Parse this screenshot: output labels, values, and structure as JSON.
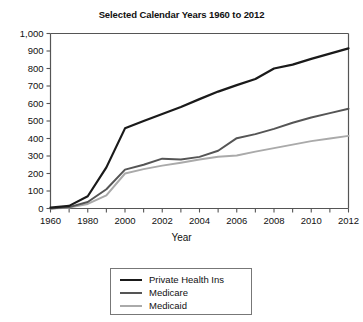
{
  "chart_data": {
    "type": "line",
    "title": "Selected Calendar Years 1960 to 2012",
    "xlabel": "Year",
    "ylabel": "",
    "ylim": [
      0,
      1000
    ],
    "ytick_labels": [
      "0",
      "100",
      "200",
      "300",
      "400",
      "500",
      "600",
      "700",
      "800",
      "900",
      "1,000"
    ],
    "ytick_values": [
      0,
      100,
      200,
      300,
      400,
      500,
      600,
      700,
      800,
      900,
      1000
    ],
    "grid": false,
    "legend_position": "below-center",
    "x": [
      "1960",
      "1970",
      "1980",
      "1990",
      "2000",
      "2001",
      "2002",
      "2003",
      "2004",
      "2005",
      "2006",
      "2007",
      "2008",
      "2009",
      "2010",
      "2011",
      "2012"
    ],
    "categories": [
      "1960",
      "1970",
      "1980",
      "1990",
      "2000",
      "2001",
      "2002",
      "2003",
      "2004",
      "2005",
      "2006",
      "2007",
      "2008",
      "2009",
      "2010",
      "2011",
      "2012"
    ],
    "xtick_labels": [
      "1960",
      "",
      "1980",
      "",
      "2000",
      "",
      "2002",
      "",
      "2004",
      "",
      "2006",
      "",
      "2008",
      "",
      "2010",
      "",
      "2012"
    ],
    "series": [
      {
        "name": "Private Health Ins",
        "color": "#1a1a1a",
        "width": 2.2,
        "values": [
          5,
          15,
          70,
          235,
          458,
          500,
          540,
          580,
          625,
          668,
          705,
          740,
          800,
          822,
          855,
          885,
          915
        ]
      },
      {
        "name": "Medicare",
        "color": "#555555",
        "width": 2.0,
        "values": [
          0,
          8,
          37,
          110,
          222,
          250,
          285,
          280,
          295,
          330,
          402,
          425,
          455,
          490,
          520,
          545,
          570
        ]
      },
      {
        "name": "Medicaid",
        "color": "#aaaaaa",
        "width": 2.0,
        "values": [
          0,
          5,
          26,
          75,
          200,
          225,
          245,
          262,
          280,
          296,
          303,
          325,
          345,
          365,
          385,
          400,
          415
        ]
      }
    ],
    "legend": [
      {
        "label": "Private Health Ins",
        "color": "#1a1a1a"
      },
      {
        "label": "Medicare",
        "color": "#555555"
      },
      {
        "label": "Medicaid",
        "color": "#aaaaaa"
      }
    ]
  }
}
